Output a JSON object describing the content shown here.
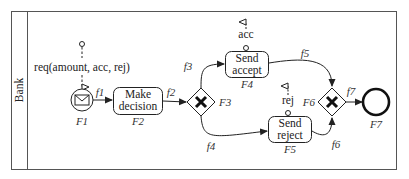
{
  "pool": {
    "lane_label": "Bank"
  },
  "data_input": {
    "label": "req(amount, acc, rej)"
  },
  "nodes": {
    "F1": {
      "id": "F1",
      "type": "message-start-event"
    },
    "F2": {
      "id": "F2",
      "type": "task",
      "line1": "Make",
      "line2": "decision"
    },
    "F3": {
      "id": "F3",
      "type": "exclusive-gateway"
    },
    "F4": {
      "id": "F4",
      "type": "task",
      "line1": "Send",
      "line2": "accept",
      "output": "acc"
    },
    "F5": {
      "id": "F5",
      "type": "task",
      "line1": "Send",
      "line2": "reject",
      "output": "rej"
    },
    "F6": {
      "id": "F6",
      "type": "exclusive-gateway"
    },
    "F7": {
      "id": "F7",
      "type": "end-event"
    }
  },
  "flows": {
    "f1": "f1",
    "f2": "f2",
    "f3": "f3",
    "f4": "f4",
    "f5": "f5",
    "f6": "f6",
    "f7": "f7"
  },
  "colors": {
    "stroke": "#222222",
    "background": "#ffffff",
    "frame": "#555555"
  }
}
